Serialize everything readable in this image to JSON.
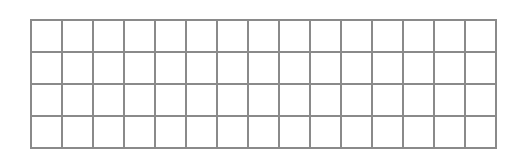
{
  "grid": {
    "rows": 4,
    "columns": 15,
    "cell_width": 31,
    "cell_height": 32,
    "line_color": "#8a8a8a",
    "background_color": "#ffffff",
    "cells": []
  }
}
